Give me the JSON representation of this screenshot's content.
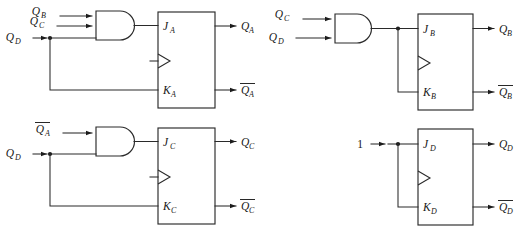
{
  "diagram": {
    "type": "digital-logic-schematic",
    "background_color": "#ffffff",
    "line_color": "#2a2a2a",
    "text_color": "#171717",
    "circuits": [
      {
        "id": "stage-a",
        "gate": {
          "type": "AND",
          "inputs": [
            "Q_B",
            "Q_C",
            "Q_D"
          ],
          "input_labels": [
            {
              "base": "Q",
              "sub": "B",
              "overbar": false
            },
            {
              "base": "Q",
              "sub": "C",
              "overbar": false
            },
            {
              "base": "Q",
              "sub": "D",
              "overbar": false
            }
          ]
        },
        "flipflop": {
          "j_label": {
            "base": "J",
            "sub": "A",
            "overbar": false
          },
          "k_label": {
            "base": "K",
            "sub": "A",
            "overbar": false
          },
          "clock": "edge-triangle",
          "q_label": {
            "base": "Q",
            "sub": "A",
            "overbar": false
          },
          "qbar_label": {
            "base": "Q",
            "sub": "A",
            "overbar": true
          }
        },
        "k_source": "Q_D"
      },
      {
        "id": "stage-b",
        "gate": {
          "type": "AND",
          "inputs": [
            "Q_C",
            "Q_D"
          ],
          "input_labels": [
            {
              "base": "Q",
              "sub": "C",
              "overbar": false
            },
            {
              "base": "Q",
              "sub": "D",
              "overbar": false
            }
          ]
        },
        "flipflop": {
          "j_label": {
            "base": "J",
            "sub": "B",
            "overbar": false
          },
          "k_label": {
            "base": "K",
            "sub": "B",
            "overbar": false
          },
          "clock": "edge-triangle",
          "q_label": {
            "base": "Q",
            "sub": "B",
            "overbar": false
          },
          "qbar_label": {
            "base": "Q",
            "sub": "B",
            "overbar": true
          }
        },
        "k_source": "gate-output"
      },
      {
        "id": "stage-c",
        "gate": {
          "type": "AND",
          "inputs": [
            "Qbar_A",
            "Q_D"
          ],
          "input_labels": [
            {
              "base": "Q",
              "sub": "A",
              "overbar": true
            },
            {
              "base": "Q",
              "sub": "D",
              "overbar": false
            }
          ]
        },
        "flipflop": {
          "j_label": {
            "base": "J",
            "sub": "C",
            "overbar": false
          },
          "k_label": {
            "base": "K",
            "sub": "C",
            "overbar": false
          },
          "clock": "edge-triangle",
          "q_label": {
            "base": "Q",
            "sub": "C",
            "overbar": false
          },
          "qbar_label": {
            "base": "Q",
            "sub": "C",
            "overbar": true
          }
        },
        "k_source": "Q_D"
      },
      {
        "id": "stage-d",
        "gate": null,
        "constant_input": "1",
        "flipflop": {
          "j_label": {
            "base": "J",
            "sub": "D",
            "overbar": false
          },
          "k_label": {
            "base": "K",
            "sub": "D",
            "overbar": false
          },
          "clock": "edge-triangle",
          "q_label": {
            "base": "Q",
            "sub": "D",
            "overbar": false
          },
          "qbar_label": {
            "base": "Q",
            "sub": "D",
            "overbar": true
          }
        },
        "k_source": "constant-1"
      }
    ]
  },
  "labels": {
    "a_in_qb": "Q",
    "a_in_qb_sub": "B",
    "a_in_qc": "Q",
    "a_in_qc_sub": "C",
    "a_in_qd": "Q",
    "a_in_qd_sub": "D",
    "a_j": "J",
    "a_j_sub": "A",
    "a_k": "K",
    "a_k_sub": "A",
    "a_q": "Q",
    "a_q_sub": "A",
    "a_qbar": "Q",
    "a_qbar_sub": "A",
    "b_in_qc": "Q",
    "b_in_qc_sub": "C",
    "b_in_qd": "Q",
    "b_in_qd_sub": "D",
    "b_j": "J",
    "b_j_sub": "B",
    "b_k": "K",
    "b_k_sub": "B",
    "b_q": "Q",
    "b_q_sub": "B",
    "b_qbar": "Q",
    "b_qbar_sub": "B",
    "c_in_qabar": "Q",
    "c_in_qabar_sub": "A",
    "c_in_qd": "Q",
    "c_in_qd_sub": "D",
    "c_j": "J",
    "c_j_sub": "C",
    "c_k": "K",
    "c_k_sub": "C",
    "c_q": "Q",
    "c_q_sub": "C",
    "c_qbar": "Q",
    "c_qbar_sub": "C",
    "d_in_one": "1",
    "d_j": "J",
    "d_j_sub": "D",
    "d_k": "K",
    "d_k_sub": "D",
    "d_q": "Q",
    "d_q_sub": "D",
    "d_qbar": "Q",
    "d_qbar_sub": "D"
  }
}
